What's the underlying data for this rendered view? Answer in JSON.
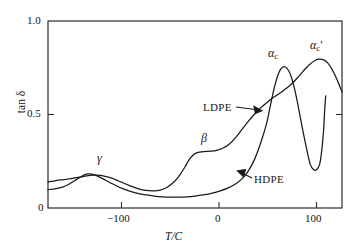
{
  "chart_data": {
    "type": "line",
    "title": "",
    "xlabel": "T/C",
    "ylabel": "tan δ",
    "xlim": [
      -160,
      128
    ],
    "ylim": [
      0,
      1.0
    ],
    "xticks": [
      -100,
      0,
      100
    ],
    "xtick_labels": [
      "−100",
      "0",
      "100"
    ],
    "yticks": [
      0,
      0.5,
      1.0
    ],
    "ytick_labels": [
      "0",
      "0.5",
      "1.0"
    ],
    "grid": false,
    "legend": "inline-annotations",
    "annotations": [
      {
        "name": "gamma-peak",
        "text": "γ",
        "x": -112,
        "y": 0.3
      },
      {
        "name": "beta-peak",
        "text": "β",
        "x": -14,
        "y": 0.41
      },
      {
        "name": "alpha-c-peak",
        "text": "αc",
        "x": 60,
        "y": 0.86
      },
      {
        "name": "alpha-c-prime-peak",
        "text": "αc′",
        "x": 104,
        "y": 0.91
      },
      {
        "name": "ldpe-label",
        "text": "LDPE",
        "x": -16,
        "y": 0.575
      },
      {
        "name": "hdpe-label",
        "text": "HDPE",
        "x": 37,
        "y": 0.19
      }
    ],
    "series": [
      {
        "name": "LDPE",
        "label": "LDPE",
        "color": "#1a1a1a",
        "points": [
          [
            -160,
            0.14
          ],
          [
            -152,
            0.147
          ],
          [
            -144,
            0.152
          ],
          [
            -136,
            0.158
          ],
          [
            -128,
            0.166
          ],
          [
            -122,
            0.172
          ],
          [
            -116,
            0.176
          ],
          [
            -112,
            0.176
          ],
          [
            -106,
            0.172
          ],
          [
            -100,
            0.164
          ],
          [
            -94,
            0.152
          ],
          [
            -88,
            0.138
          ],
          [
            -80,
            0.12
          ],
          [
            -72,
            0.104
          ],
          [
            -64,
            0.094
          ],
          [
            -56,
            0.092
          ],
          [
            -50,
            0.096
          ],
          [
            -44,
            0.108
          ],
          [
            -38,
            0.132
          ],
          [
            -32,
            0.168
          ],
          [
            -26,
            0.218
          ],
          [
            -22,
            0.256
          ],
          [
            -18,
            0.282
          ],
          [
            -14,
            0.296
          ],
          [
            -8,
            0.302
          ],
          [
            0,
            0.304
          ],
          [
            6,
            0.31
          ],
          [
            12,
            0.322
          ],
          [
            18,
            0.344
          ],
          [
            24,
            0.378
          ],
          [
            30,
            0.42
          ],
          [
            36,
            0.462
          ],
          [
            42,
            0.5
          ],
          [
            48,
            0.534
          ],
          [
            54,
            0.562
          ],
          [
            60,
            0.588
          ],
          [
            66,
            0.61
          ],
          [
            72,
            0.634
          ],
          [
            78,
            0.66
          ],
          [
            84,
            0.694
          ],
          [
            90,
            0.732
          ],
          [
            96,
            0.766
          ],
          [
            102,
            0.79
          ],
          [
            106,
            0.796
          ],
          [
            110,
            0.792
          ],
          [
            114,
            0.776
          ],
          [
            118,
            0.744
          ],
          [
            122,
            0.7
          ],
          [
            126,
            0.648
          ],
          [
            128,
            0.62
          ]
        ]
      },
      {
        "name": "HDPE",
        "label": "HDPE",
        "color": "#1a1a1a",
        "points": [
          [
            -160,
            0.098
          ],
          [
            -152,
            0.104
          ],
          [
            -146,
            0.112
          ],
          [
            -140,
            0.126
          ],
          [
            -134,
            0.146
          ],
          [
            -128,
            0.166
          ],
          [
            -124,
            0.178
          ],
          [
            -120,
            0.182
          ],
          [
            -116,
            0.18
          ],
          [
            -112,
            0.172
          ],
          [
            -106,
            0.156
          ],
          [
            -100,
            0.138
          ],
          [
            -94,
            0.122
          ],
          [
            -88,
            0.106
          ],
          [
            -80,
            0.09
          ],
          [
            -72,
            0.078
          ],
          [
            -64,
            0.07
          ],
          [
            -56,
            0.064
          ],
          [
            -48,
            0.06
          ],
          [
            -40,
            0.058
          ],
          [
            -32,
            0.058
          ],
          [
            -24,
            0.06
          ],
          [
            -16,
            0.064
          ],
          [
            -8,
            0.07
          ],
          [
            0,
            0.078
          ],
          [
            8,
            0.09
          ],
          [
            16,
            0.106
          ],
          [
            24,
            0.13
          ],
          [
            30,
            0.156
          ],
          [
            36,
            0.196
          ],
          [
            42,
            0.256
          ],
          [
            48,
            0.342
          ],
          [
            54,
            0.45
          ],
          [
            58,
            0.552
          ],
          [
            62,
            0.65
          ],
          [
            66,
            0.722
          ],
          [
            70,
            0.754
          ],
          [
            74,
            0.748
          ],
          [
            78,
            0.706
          ],
          [
            82,
            0.626
          ],
          [
            86,
            0.518
          ],
          [
            90,
            0.404
          ],
          [
            94,
            0.3
          ],
          [
            97,
            0.232
          ],
          [
            100,
            0.206
          ],
          [
            103,
            0.204
          ],
          [
            106,
            0.232
          ],
          [
            108,
            0.3
          ],
          [
            110,
            0.42
          ],
          [
            111,
            0.52
          ],
          [
            112,
            0.6
          ]
        ]
      }
    ]
  },
  "axes": {
    "y_title": "tan δ",
    "x_title": "T/C",
    "y_ticks": {
      "top": "1.0",
      "mid": "0.5",
      "bottom": "0"
    },
    "x_ticks": {
      "minus100": "−100",
      "zero": "0",
      "hundred": "100"
    }
  },
  "labels": {
    "gamma": "γ",
    "beta": "β",
    "alpha_c_base": "α",
    "alpha_c_sub": "c",
    "alpha_c_prime_base": "α",
    "alpha_c_prime_sub": "c",
    "alpha_c_prime_mark": "′",
    "ldpe": "LDPE",
    "hdpe": "HDPE"
  },
  "style": {
    "line_color": "#1a1a1a",
    "axis_color": "#2b2b2b",
    "background": "#ffffff"
  }
}
